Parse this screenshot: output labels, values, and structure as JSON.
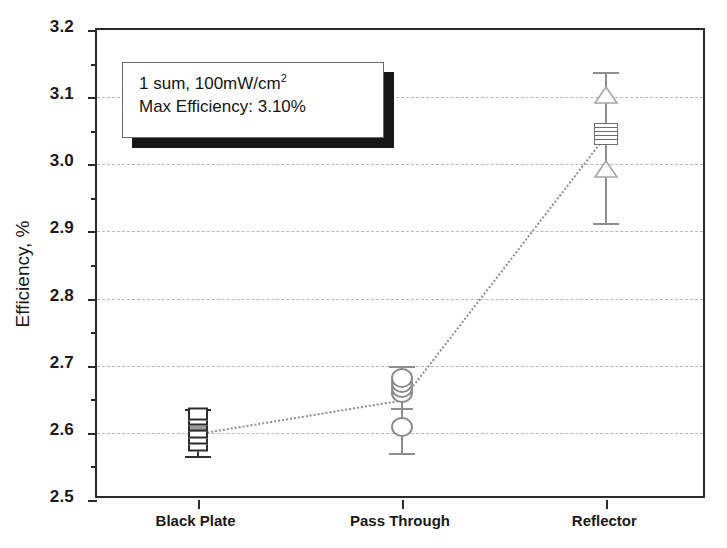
{
  "chart_data": {
    "type": "scatter",
    "title": "",
    "xlabel": "",
    "ylabel": "Efficiency, %",
    "ylim": [
      2.5,
      3.2
    ],
    "ytick_step": 0.1,
    "yminor_step": 0.05,
    "grid": "horizontal dashed at major ticks",
    "legend": "none",
    "categories": [
      "Black Plate",
      "Pass Through",
      "Reflector"
    ],
    "ytick_labels": [
      "2.5",
      "2.6",
      "2.7",
      "2.8",
      "2.9",
      "3.0",
      "3.1",
      "3.2"
    ],
    "ytick_values": [
      2.5,
      2.6,
      2.7,
      2.8,
      2.9,
      3.0,
      3.1,
      3.2
    ],
    "series": [
      {
        "name": "Mean trend",
        "style": "dotted line",
        "values": [
          2.6,
          2.65,
          3.045
        ]
      }
    ],
    "groups": [
      {
        "category": "Black Plate",
        "marker": "square",
        "mean": 2.6,
        "whisker_low": 2.565,
        "whisker_high": 2.635,
        "points": [
          2.582,
          2.592,
          2.601,
          2.611,
          2.621,
          2.628
        ]
      },
      {
        "category": "Pass Through",
        "marker": "circle",
        "mean": 2.65,
        "whisker_low": 2.57,
        "whisker_high": 2.7,
        "points": [
          2.608,
          2.659,
          2.667,
          2.675,
          2.681
        ]
      },
      {
        "category": "Reflector",
        "marker": "triangle",
        "mean": 3.045,
        "whisker_low": 2.912,
        "whisker_high": 3.138,
        "points": [
          3.04,
          3.045,
          3.05,
          3.055,
          3.1,
          2.99
        ]
      }
    ],
    "annotation": {
      "line1_prefix": "1 sum, 100mW/cm",
      "line1_sup": "2",
      "line2": "Max Efficiency: 3.10%"
    },
    "colors": {
      "axis": "#2b2b2b",
      "grid": "#b9b9b9",
      "trend": "#8e8e8e",
      "marker_edge": "#2d2d2d",
      "marker_fill": "#ffffff",
      "annotation_shadow": "#171717"
    }
  }
}
